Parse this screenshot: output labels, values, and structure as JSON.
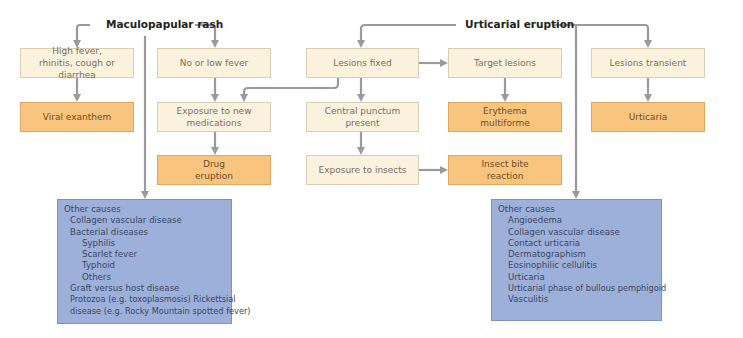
{
  "diagram": {
    "colors": {
      "line": "#9a9a9a",
      "light_box": "#fbf2de",
      "result_box": "#f8c47e",
      "causes_box": "#9cb0d9"
    },
    "roots": {
      "maculopapular": "Maculopapular rash",
      "urticarial": "Urticarial eruption"
    },
    "nodes": {
      "high_fever": "High fever, rhinitis, cough or diarrhea",
      "viral_exanthem": "Viral exanthem",
      "no_low_fever": "No or low fever",
      "exposure_meds": "Exposure to new medications",
      "drug_eruption": "Drug eruption",
      "lesions_fixed": "Lesions fixed",
      "central_punctum": "Central punctum present",
      "exposure_insects": "Exposure to insects",
      "target_lesions": "Target lesions",
      "erythema_multiforme": "Erythema multiforme",
      "insect_bite": "Insect bite reaction",
      "lesions_transient": "Lesions transient",
      "urticaria": "Urticaria"
    },
    "other_causes_left": {
      "title": "Other causes",
      "items": [
        {
          "text": "Collagen vascular disease",
          "level": 1
        },
        {
          "text": "Bacterial diseases",
          "level": 1
        },
        {
          "text": "Syphilis",
          "level": 2
        },
        {
          "text": "Scarlet fever",
          "level": 2
        },
        {
          "text": "Typhoid",
          "level": 2
        },
        {
          "text": "Others",
          "level": 2
        },
        {
          "text": "Graft versus host disease",
          "level": 1
        },
        {
          "text": "Protozoa (e.g. toxoplasmosis) Rickettsial",
          "level": 1
        },
        {
          "text": "disease (e.g. Rocky Mountain spotted fever)",
          "level": 1
        }
      ]
    },
    "other_causes_right": {
      "title": "Other causes",
      "items": [
        {
          "text": "Angioedema",
          "level": 2
        },
        {
          "text": "Collagen vascular disease",
          "level": 2
        },
        {
          "text": "Contact urticaria",
          "level": 2
        },
        {
          "text": "Dermatographism",
          "level": 2
        },
        {
          "text": "Eosinophilic cellulitis",
          "level": 2
        },
        {
          "text": "Urticaria",
          "level": 2
        },
        {
          "text": "Urticarial phase of bullous pemphigoid",
          "level": 2
        },
        {
          "text": "Vasculitis",
          "level": 2
        }
      ]
    }
  }
}
